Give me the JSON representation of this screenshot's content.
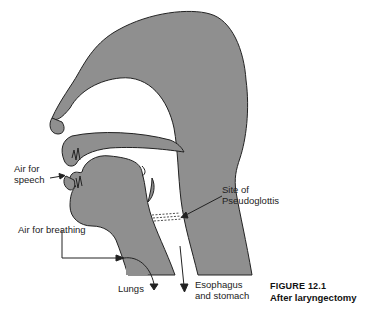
{
  "figure": {
    "number": "FIGURE 12.1",
    "caption": "After laryngectomy"
  },
  "labels": {
    "air_for_speech_line1": "Air for",
    "air_for_speech_line2": "speech",
    "site_line1": "Site of",
    "site_line2": "Pseudoglottis",
    "air_for_breathing": "Air for breathing",
    "lungs": "Lungs",
    "esophagus_line1": "Esophagus",
    "esophagus_line2": "and stomach"
  },
  "colors": {
    "tissue": "#8f8f8f",
    "outline": "#222222",
    "background": "#ffffff"
  }
}
